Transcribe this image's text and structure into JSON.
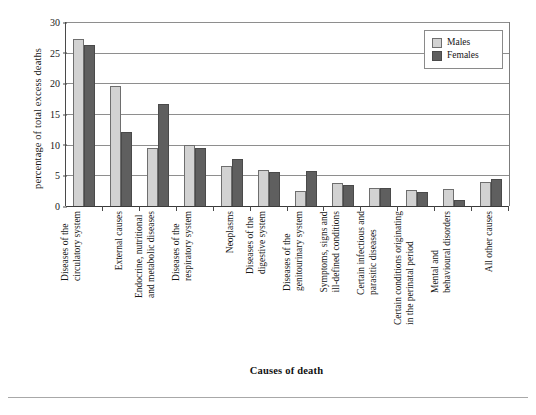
{
  "chart_data": {
    "type": "bar",
    "title": "",
    "xlabel": "Causes of death",
    "ylabel": "percentage of total excess deaths",
    "ylim": [
      0,
      30
    ],
    "yticks": [
      0,
      5,
      10,
      15,
      20,
      25,
      30
    ],
    "grid": true,
    "legend_position": "top-right",
    "categories": [
      "Diseases of the circulatory system",
      "External causes",
      "Endocrine, nutritional and metabolic diseases",
      "Diseases of the respiratory system",
      "Neoplasms",
      "Diseases of the digestive system",
      "Diseases of the genitourinary system",
      "Symptoms, signs and ill-defined conditions",
      "Certain infectious and parasitic diseases",
      "Certain conditions originating in the perinatal period",
      "Mental and behavioural disorders",
      "All other causes"
    ],
    "category_lines": [
      [
        "Diseases of the",
        "circulatory system"
      ],
      [
        "External causes"
      ],
      [
        "Endocrine, nutritional",
        "and metabolic diseases"
      ],
      [
        "Diseases of the",
        "respiratory system"
      ],
      [
        "Neoplasms"
      ],
      [
        "Diseases of the",
        "digestive system"
      ],
      [
        "Diseases of the",
        "genitourinary system"
      ],
      [
        "Symptoms, signs and",
        "ill-defined conditions"
      ],
      [
        "Certain infectious and",
        "parasitic diseases"
      ],
      [
        "Certain conditions originating",
        "in the perinatal period"
      ],
      [
        "Mental and",
        "behavioural disorders"
      ],
      [
        "All other causes"
      ]
    ],
    "series": [
      {
        "name": "Males",
        "color": "#d2d2d2",
        "values": [
          27.2,
          19.5,
          9.5,
          9.9,
          6.5,
          5.8,
          2.5,
          3.8,
          2.9,
          2.6,
          2.7,
          3.9
        ]
      },
      {
        "name": "Females",
        "color": "#5f5f5f",
        "values": [
          26.3,
          12.0,
          16.6,
          9.4,
          7.6,
          5.5,
          5.7,
          3.4,
          2.9,
          2.3,
          1.0,
          4.4
        ]
      }
    ]
  },
  "legend": {
    "items": [
      {
        "label": "Males"
      },
      {
        "label": "Females"
      }
    ]
  },
  "axis": {
    "y_title": "percentage of total excess deaths",
    "x_title": "Causes of death",
    "tick_labels": [
      "30",
      "25",
      "20",
      "15",
      "10",
      "5",
      "0"
    ]
  }
}
